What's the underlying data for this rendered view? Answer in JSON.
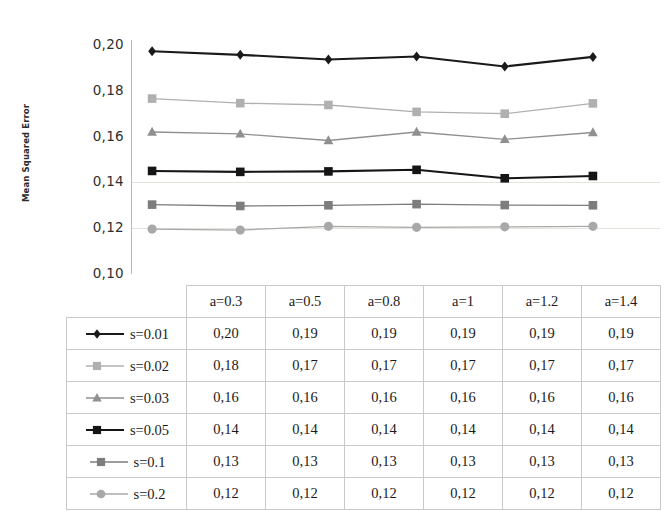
{
  "axis": {
    "y_title": "Mean Squared Error",
    "y_ticks": [
      "0,20",
      "0,18",
      "0,16",
      "0,14",
      "0,12",
      "0,10"
    ]
  },
  "table": {
    "corner_label": "",
    "columns": [
      "a=0.3",
      "a=0.5",
      "a=0.8",
      "a=1",
      "a=1.2",
      "a=1.4"
    ],
    "rows": [
      {
        "legend": "s=0.01",
        "marker": "diamond",
        "color": "#1a1a1a",
        "values": [
          "0,20",
          "0,19",
          "0,19",
          "0,19",
          "0,19",
          "0,19"
        ]
      },
      {
        "legend": "s=0.02",
        "marker": "square",
        "color": "#b0b0b0",
        "values": [
          "0,18",
          "0,17",
          "0,17",
          "0,17",
          "0,17",
          "0,17"
        ]
      },
      {
        "legend": "s=0.03",
        "marker": "triangle",
        "color": "#909090",
        "values": [
          "0,16",
          "0,16",
          "0,16",
          "0,16",
          "0,16",
          "0,16"
        ]
      },
      {
        "legend": "s=0.05",
        "marker": "square",
        "color": "#151515",
        "values": [
          "0,14",
          "0,14",
          "0,14",
          "0,14",
          "0,14",
          "0,14"
        ]
      },
      {
        "legend": "s=0.1",
        "marker": "square",
        "color": "#7d7d7d",
        "values": [
          "0,13",
          "0,13",
          "0,13",
          "0,13",
          "0,13",
          "0,13"
        ]
      },
      {
        "legend": "s=0.2",
        "marker": "circle",
        "color": "#a8a8a8",
        "values": [
          "0,12",
          "0,12",
          "0,12",
          "0,12",
          "0,12",
          "0,12"
        ]
      }
    ]
  },
  "chart_data": {
    "type": "line",
    "title": "",
    "xlabel": "",
    "ylabel": "Mean Squared Error",
    "categories": [
      "a=0.3",
      "a=0.5",
      "a=0.8",
      "a=1",
      "a=1.2",
      "a=1.4"
    ],
    "ylim": [
      0.1,
      0.2
    ],
    "ytick_values": [
      0.2,
      0.18,
      0.16,
      0.14,
      0.12,
      0.1
    ],
    "grid": "horizontal-faint",
    "legend_position": "data-table-left",
    "series": [
      {
        "name": "s=0.01",
        "marker": "diamond",
        "color": "#1a1a1a",
        "values": [
          0.1973,
          0.1957,
          0.1937,
          0.195,
          0.1906,
          0.1948
        ],
        "labels": [
          "0,20",
          "0,19",
          "0,19",
          "0,19",
          "0,19",
          "0,19"
        ]
      },
      {
        "name": "s=0.02",
        "marker": "square",
        "color": "#b0b0b0",
        "values": [
          0.1766,
          0.1746,
          0.1738,
          0.1708,
          0.17,
          0.1745
        ],
        "labels": [
          "0,18",
          "0,17",
          "0,17",
          "0,17",
          "0,17",
          "0,17"
        ]
      },
      {
        "name": "s=0.03",
        "marker": "triangle",
        "color": "#909090",
        "values": [
          0.162,
          0.1612,
          0.1583,
          0.162,
          0.1588,
          0.1618
        ],
        "labels": [
          "0,16",
          "0,16",
          "0,16",
          "0,16",
          "0,16",
          "0,16"
        ]
      },
      {
        "name": "s=0.05",
        "marker": "square",
        "color": "#151515",
        "values": [
          0.145,
          0.1446,
          0.1448,
          0.1455,
          0.1418,
          0.1428
        ],
        "labels": [
          "0,14",
          "0,14",
          "0,14",
          "0,14",
          "0,14",
          "0,14"
        ]
      },
      {
        "name": "s=0.1",
        "marker": "square",
        "color": "#7d7d7d",
        "values": [
          0.1303,
          0.1297,
          0.13,
          0.1305,
          0.1301,
          0.13
        ],
        "labels": [
          "0,13",
          "0,13",
          "0,13",
          "0,13",
          "0,13",
          "0,13"
        ]
      },
      {
        "name": "s=0.2",
        "marker": "circle",
        "color": "#a8a8a8",
        "values": [
          0.1196,
          0.1192,
          0.1208,
          0.1204,
          0.1206,
          0.1208
        ],
        "labels": [
          "0,12",
          "0,12",
          "0,12",
          "0,12",
          "0,12",
          "0,12"
        ]
      }
    ]
  }
}
